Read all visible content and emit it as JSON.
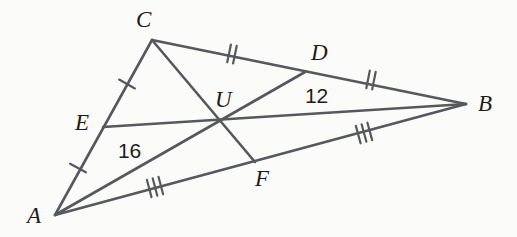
{
  "figure": {
    "kind": "geometry-diagram",
    "background_color": "#fbfbfa",
    "stroke_color": "#55585c",
    "text_color": "#1c1c1c",
    "width": 517,
    "height": 237
  },
  "points": {
    "A": {
      "label": "A",
      "x": 55,
      "y": 215
    },
    "B": {
      "label": "B",
      "x": 466,
      "y": 104
    },
    "C": {
      "label": "C",
      "x": 152,
      "y": 40
    },
    "D": {
      "label": "D",
      "x": 305,
      "y": 72
    },
    "E": {
      "label": "E",
      "x": 103,
      "y": 127
    },
    "F": {
      "label": "F",
      "x": 255,
      "y": 162
    },
    "U": {
      "label": "U",
      "x": 222,
      "y": 122
    }
  },
  "segments": [
    {
      "name": "side-AC",
      "from": "A",
      "to": "C"
    },
    {
      "name": "side-CB",
      "from": "C",
      "to": "B"
    },
    {
      "name": "side-AB",
      "from": "A",
      "to": "B"
    },
    {
      "name": "median-AD",
      "from": "A",
      "to": "D"
    },
    {
      "name": "median-BE",
      "from": "B",
      "to": "E"
    },
    {
      "name": "median-CF",
      "from": "C",
      "to": "F"
    }
  ],
  "tick_marks": [
    {
      "name": "tick-AE",
      "segment": "A-E",
      "count": 1,
      "x": 78,
      "y": 168
    },
    {
      "name": "tick-EC",
      "segment": "E-C",
      "count": 1,
      "x": 127,
      "y": 84
    },
    {
      "name": "tick-CD",
      "segment": "C-D",
      "count": 2,
      "x": 232,
      "y": 54
    },
    {
      "name": "tick-DB",
      "segment": "D-B",
      "count": 2,
      "x": 371,
      "y": 80
    },
    {
      "name": "tick-AF",
      "segment": "A-F",
      "count": 3,
      "x": 155,
      "y": 187
    },
    {
      "name": "tick-FB",
      "segment": "F-B",
      "count": 3,
      "x": 364,
      "y": 133
    }
  ],
  "measures": [
    {
      "name": "measure-AU",
      "value": "16",
      "on_segment": "A-U",
      "x": 118,
      "y": 140
    },
    {
      "name": "measure-UD",
      "value": "12",
      "on_segment": "U-D",
      "x": 305,
      "y": 85
    }
  ]
}
